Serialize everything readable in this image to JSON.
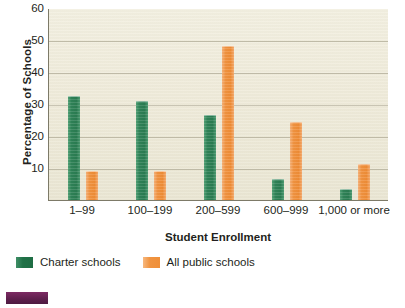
{
  "chart_data": {
    "type": "bar",
    "title": "",
    "xlabel": "Student Enrollment",
    "ylabel": "Percentage of Schools",
    "categories": [
      "1–99",
      "100–199",
      "200–599",
      "600–999",
      "1,000 or more"
    ],
    "series": [
      {
        "name": "Charter schools",
        "color": "#2f8257",
        "values": [
          32.5,
          31.0,
          26.5,
          6.7,
          3.5
        ]
      },
      {
        "name": "All public schools",
        "color": "#ee8c36",
        "values": [
          9.2,
          9.0,
          48.2,
          24.5,
          11.2
        ]
      }
    ],
    "ylim": [
      0,
      60
    ],
    "yticks": [
      10,
      20,
      30,
      40,
      50,
      60
    ],
    "ytick_labels": [
      "10",
      "20",
      "30",
      "40",
      "50",
      "60"
    ],
    "grid": true,
    "legend_position": "bottom-left",
    "plot_background": "#efebda",
    "axis_color": "#7d7a68",
    "gridline_color": "#b9b4a0"
  },
  "legend": {
    "items": [
      {
        "label": "Charter schools"
      },
      {
        "label": "All public schools"
      }
    ]
  },
  "artifact": {
    "color": "#5d1f4c"
  }
}
